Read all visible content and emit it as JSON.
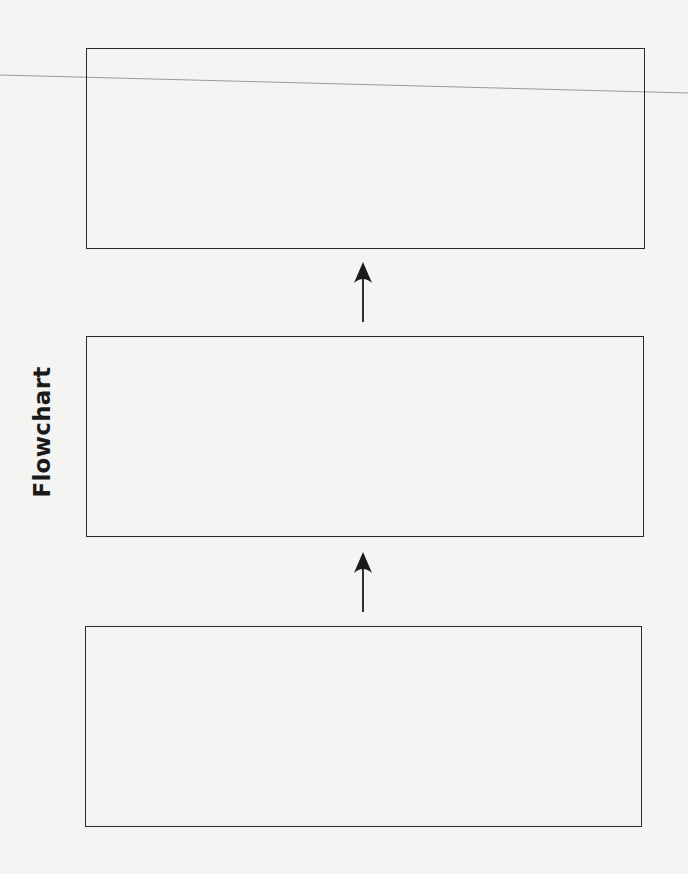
{
  "diagram": {
    "title": "Flowchart",
    "orientation": "bottom-to-top",
    "boxes": [
      {
        "id": "box-top",
        "label": ""
      },
      {
        "id": "box-middle",
        "label": ""
      },
      {
        "id": "box-bottom",
        "label": ""
      }
    ],
    "arrows": [
      {
        "from": "box-middle",
        "to": "box-top"
      },
      {
        "from": "box-bottom",
        "to": "box-middle"
      }
    ],
    "colors": {
      "background": "#f4f4f3",
      "stroke": "#2a2a2a",
      "scan_line": "#9a9a9a"
    }
  }
}
